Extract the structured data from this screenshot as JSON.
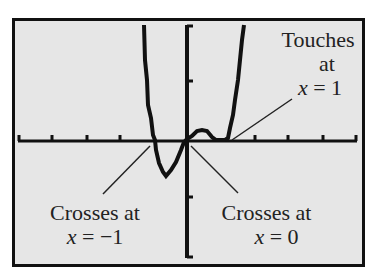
{
  "diagram": {
    "annotations": [
      {
        "id": "touches",
        "line1": "Touches",
        "line2": "at",
        "var": "x",
        "eq": "= 1"
      },
      {
        "id": "crosses_neg1",
        "line1": "Crosses at",
        "var": "x",
        "eq": "= −1"
      },
      {
        "id": "crosses_0",
        "line1": "Crosses at",
        "var": "x",
        "eq": "= 0"
      }
    ],
    "zeros": [
      {
        "x": -1,
        "behavior": "crosses"
      },
      {
        "x": 0,
        "behavior": "crosses"
      },
      {
        "x": 1,
        "behavior": "touches"
      }
    ]
  }
}
